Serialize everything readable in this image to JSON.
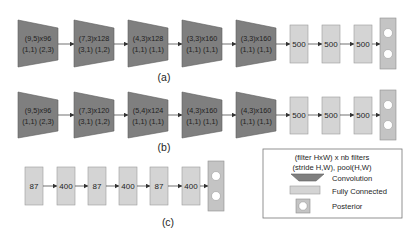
{
  "diagram": {
    "colors": {
      "convolution": "#7f7f7f",
      "fully_connected": "#d4d4d4",
      "posterior": "#c4c4c4",
      "arrow": "#333333"
    },
    "row_a": {
      "label": "(a)",
      "conv_layers": [
        {
          "line1": "(9,5)x96",
          "line2": "(1,1) (2,3)"
        },
        {
          "line1": "(7,3)x128",
          "line2": "(3,1) (1,2)"
        },
        {
          "line1": "(4,3)x128",
          "line2": "(1,1) (1,1)"
        },
        {
          "line1": "(3,3)x160",
          "line2": "(1,1) (1,1)"
        },
        {
          "line1": "(3,3)x160",
          "line2": "(1,1) (1,1)"
        }
      ],
      "fc_layers": [
        "500",
        "500",
        "500"
      ],
      "posterior": "posterior"
    },
    "row_b": {
      "label": "(b)",
      "conv_layers": [
        {
          "line1": "(9,5)x96",
          "line2": "(1,1) (2,3)"
        },
        {
          "line1": "(7,3)x120",
          "line2": "(3,1) (1,2)"
        },
        {
          "line1": "(5,4)x124",
          "line2": "(1,1) (1,1)"
        },
        {
          "line1": "(4,3)x160",
          "line2": "(1,1) (1,1)"
        },
        {
          "line1": "(4,3)x160",
          "line2": "(1,1) (1,1)"
        }
      ],
      "fc_layers": [
        "500",
        "500",
        "500"
      ],
      "posterior": "posterior"
    },
    "row_c": {
      "label": "(c)",
      "fc_layers": [
        "87",
        "400",
        "87",
        "400",
        "87",
        "400"
      ],
      "posterior": "posterior"
    },
    "legend": {
      "header_line1": "(filter HxW) x nb filters",
      "header_line2": "(stride H,W), pool(H,W)",
      "items": [
        {
          "icon": "convolution-trapezoid",
          "label": "Convolution"
        },
        {
          "icon": "fully-connected-rect",
          "label": "Fully Connected"
        },
        {
          "icon": "posterior-circle",
          "label": "Posterior"
        }
      ]
    }
  }
}
